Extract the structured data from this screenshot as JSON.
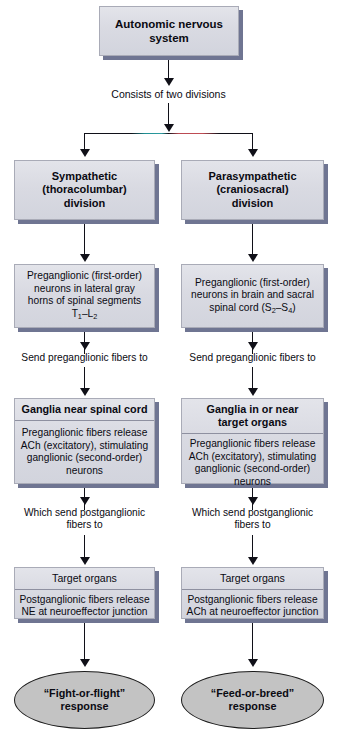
{
  "diagram": {
    "root": {
      "label": "Autonomic nervous system"
    },
    "connector_labels": {
      "consists": "Consists of two divisions",
      "send_pre_left": "Send preganglionic fibers to",
      "send_pre_right": "Send preganglionic fibers to",
      "which_send_left_line1": "Which send postganglionic",
      "which_send_left_line2": "fibers to",
      "which_send_right_line1": "Which send postganglionic",
      "which_send_right_line2": "fibers to"
    },
    "columns": [
      {
        "id": "sympathetic",
        "division": {
          "line1": "Sympathetic",
          "line2": "(thoracolumbar)",
          "line3": "division"
        },
        "preganglionic": {
          "line1": "Preganglionic (first-order)",
          "line2": "neurons in lateral gray",
          "line3": "horns of spinal segments",
          "line4_prefix": "T",
          "line4_sub1": "1",
          "line4_mid": "–L",
          "line4_sub2": "2"
        },
        "ganglia": {
          "header": "Ganglia near spinal cord",
          "body_line1": "Preganglionic fibers release",
          "body_line2": "ACh (excitatory), stimulating",
          "body_line3": "ganglionic (second-order)",
          "body_line4": "neurons"
        },
        "target": {
          "header": "Target organs",
          "body_line1": "Postganglionic fibers release",
          "body_line2": "NE at neuroeffector junction"
        },
        "outcome": {
          "line1": "“Fight-or-flight”",
          "line2": "response"
        }
      },
      {
        "id": "parasympathetic",
        "division": {
          "line1": "Parasympathetic",
          "line2": "(craniosacral)",
          "line3": "division"
        },
        "preganglionic": {
          "line1": "Preganglionic (first-order)",
          "line2": "neurons in brain and sacral",
          "line3_prefix": "spinal cord (S",
          "line3_sub1": "2",
          "line3_mid": "–S",
          "line3_sub2": "4",
          "line3_suffix": ")"
        },
        "ganglia": {
          "header_line1": "Ganglia in or near",
          "header_line2": "target organs",
          "body_line1": "Preganglionic fibers release",
          "body_line2": "ACh (excitatory), stimulating",
          "body_line3": "ganglionic (second-order)",
          "body_line4": "neurons"
        },
        "target": {
          "header": "Target organs",
          "body_line1": "Postganglionic fibers release",
          "body_line2": "ACh at neuroeffector junction"
        },
        "outcome": {
          "line1": "“Feed-or-breed”",
          "line2": "response"
        }
      }
    ],
    "colors": {
      "box_fill": "#d9dae2",
      "box_border": "#a9abb7",
      "box_shadow": "#6f7592",
      "oval_fill": "#c3c3c3",
      "oval_border": "#1c1c1c",
      "line": "#101018",
      "text": "#0a0a12",
      "page_background": "#ffffff"
    }
  }
}
